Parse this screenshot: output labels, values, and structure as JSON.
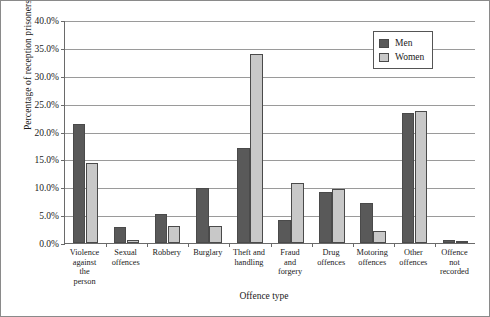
{
  "chart_data": {
    "type": "bar",
    "title": "",
    "xlabel": "Offence type",
    "ylabel": "Percentage of reception prisoners",
    "ylim": [
      0,
      40
    ],
    "ytick_step": 5,
    "ytick_labels": [
      "0.0%",
      "5.0%",
      "10.0%",
      "15.0%",
      "20.0%",
      "25.0%",
      "30.0%",
      "35.0%",
      "40.0%"
    ],
    "ytick_values": [
      0,
      5,
      10,
      15,
      20,
      25,
      30,
      35,
      40
    ],
    "grid": "horizontal",
    "legend_position": "top-right",
    "categories": [
      "Violence\nagainst\nthe\nperson",
      "Sexual\noffences",
      "Robbery",
      "Burglary",
      "Theft and\nhandling",
      "Fraud\nand\nforgery",
      "Drug\noffences",
      "Motoring\noffences",
      "Other\noffences",
      "Offence\nnot\nrecorded"
    ],
    "series": [
      {
        "name": "Men",
        "color": "#595959",
        "values": [
          21.4,
          2.9,
          5.2,
          9.8,
          17.0,
          4.1,
          9.2,
          7.2,
          23.4,
          0.6
        ]
      },
      {
        "name": "Women",
        "color": "#c8c8c8",
        "values": [
          14.3,
          0.6,
          3.0,
          3.0,
          33.9,
          10.8,
          9.6,
          2.2,
          23.6,
          0.4
        ]
      }
    ]
  },
  "legend": {
    "items": [
      {
        "label": "Men"
      },
      {
        "label": "Women"
      }
    ]
  }
}
